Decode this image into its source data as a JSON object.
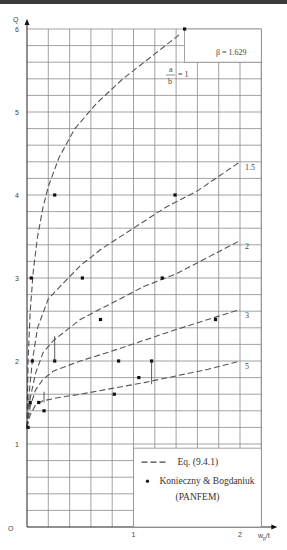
{
  "chart_data": {
    "type": "line",
    "title": "",
    "annotation": "β = 1.629",
    "curve_label_prefix": "a/b = 1",
    "xlabel": "wp/t",
    "ylabel": "Q",
    "origin_label": "O",
    "xlim": [
      0,
      2.2
    ],
    "ylim": [
      0,
      6
    ],
    "x_ticks": [
      {
        "v": 1,
        "label": "1"
      },
      {
        "v": 2,
        "label": "2"
      }
    ],
    "y_ticks": [
      {
        "v": 1,
        "label": "1"
      },
      {
        "v": 2,
        "label": "2"
      },
      {
        "v": 3,
        "label": "3"
      },
      {
        "v": 4,
        "label": "4"
      },
      {
        "v": 5,
        "label": "5"
      },
      {
        "v": 6,
        "label": "6"
      }
    ],
    "grid": true,
    "grid_step_x": 0.2,
    "grid_step_y": 0.2,
    "series": [
      {
        "name": "Eq. (9.4.1) a/b=1",
        "label": "= 1",
        "style": "dashed",
        "x": [
          0,
          0.01,
          0.03,
          0.06,
          0.1,
          0.15,
          0.2,
          0.3,
          0.45,
          0.65,
          0.9,
          1.2,
          1.45
        ],
        "y": [
          1.2,
          2.0,
          2.6,
          3.1,
          3.5,
          3.85,
          4.1,
          4.45,
          4.8,
          5.1,
          5.4,
          5.7,
          5.95
        ]
      },
      {
        "name": "Eq. (9.4.1) a/b=1.5",
        "label": "1.5",
        "style": "dashed",
        "x": [
          0,
          0.02,
          0.05,
          0.1,
          0.2,
          0.35,
          0.5,
          0.7,
          1.0,
          1.3,
          1.6,
          2.0
        ],
        "y": [
          1.2,
          1.6,
          2.0,
          2.4,
          2.75,
          2.95,
          3.15,
          3.35,
          3.6,
          3.85,
          4.05,
          4.4
        ]
      },
      {
        "name": "Eq. (9.4.1) a/b=2",
        "label": "2",
        "style": "dashed",
        "x": [
          0,
          0.03,
          0.08,
          0.15,
          0.25,
          0.3,
          0.5,
          0.8,
          1.1,
          1.4,
          1.7,
          2.0
        ],
        "y": [
          1.2,
          1.55,
          1.85,
          2.1,
          2.25,
          2.3,
          2.5,
          2.7,
          2.9,
          3.05,
          3.25,
          3.45
        ]
      },
      {
        "name": "Eq. (9.4.1) a/b=3",
        "label": "3",
        "style": "dashed",
        "x": [
          0,
          0.03,
          0.08,
          0.15,
          0.25,
          0.5,
          0.8,
          1.1,
          1.4,
          1.7,
          2.0
        ],
        "y": [
          1.2,
          1.45,
          1.65,
          1.78,
          1.88,
          2.0,
          2.12,
          2.25,
          2.38,
          2.5,
          2.62
        ]
      },
      {
        "name": "Eq. (9.4.1) a/b=5",
        "label": "5",
        "style": "dashed",
        "x": [
          0,
          0.03,
          0.08,
          0.15,
          0.3,
          0.5,
          0.8,
          1.1,
          1.4,
          1.7,
          2.0
        ],
        "y": [
          1.2,
          1.35,
          1.47,
          1.52,
          1.56,
          1.6,
          1.67,
          1.74,
          1.82,
          1.9,
          2.0
        ]
      },
      {
        "name": "Konieczny & Bogdaniuk (PANFEM)",
        "style": "points",
        "x": [
          1.48,
          0.26,
          1.39,
          0.04,
          0.52,
          1.27,
          0.69,
          1.77,
          0.05,
          0.26,
          0.86,
          1.17,
          1.05,
          0.03,
          0.11,
          0.82,
          0.16,
          0.01
        ],
        "y": [
          6.0,
          4.0,
          4.0,
          3.0,
          3.0,
          3.0,
          2.5,
          2.5,
          2.0,
          2.0,
          2.0,
          2.0,
          1.8,
          1.5,
          1.5,
          1.6,
          1.4,
          1.2
        ]
      }
    ],
    "legend": {
      "position": "lower right",
      "entries": [
        {
          "symbol": "dashed-line",
          "label": "Eq. (9.4.1)"
        },
        {
          "symbol": "dot",
          "label": "Konieczny & Bogdaniuk"
        },
        {
          "symbol": "none",
          "label": "(PANFEM)"
        }
      ]
    }
  }
}
